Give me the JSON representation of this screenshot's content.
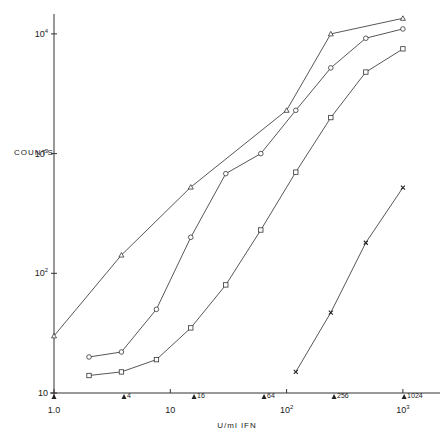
{
  "chart_data": {
    "type": "line",
    "title": "",
    "xlabel": "U/ml IFN",
    "ylabel": "COUNTS",
    "xscale": "log",
    "yscale": "log",
    "xlim": [
      1.0,
      1500
    ],
    "ylim": [
      10,
      15000
    ],
    "grid": false,
    "legend": null,
    "x_ticks": [
      {
        "value": 1,
        "label": "1.0"
      },
      {
        "value": 10,
        "label": "10"
      },
      {
        "value": 100,
        "label": "10",
        "sup": "2"
      },
      {
        "value": 1000,
        "label": "10",
        "sup": "3"
      }
    ],
    "y_ticks": [
      {
        "value": 10,
        "label": "10",
        "sup": ""
      },
      {
        "value": 100,
        "label": "10",
        "sup": "2"
      },
      {
        "value": 1000,
        "label": "10",
        "sup": "3"
      },
      {
        "value": 10000,
        "label": "10",
        "sup": "4"
      }
    ],
    "x_markers": [
      {
        "value": 1,
        "label": ""
      },
      {
        "value": 4,
        "label": "4"
      },
      {
        "value": 16,
        "label": "16"
      },
      {
        "value": 64,
        "label": "64"
      },
      {
        "value": 256,
        "label": "256"
      },
      {
        "value": 1024,
        "label": "1024"
      }
    ],
    "series": [
      {
        "name": "triangle",
        "marker": "triangle",
        "x": [
          1.0,
          3.8,
          15,
          100,
          240,
          1000
        ],
        "y": [
          30,
          142,
          525,
          2300,
          10000,
          13500
        ]
      },
      {
        "name": "circle",
        "marker": "circle",
        "x": [
          2,
          3.8,
          7.6,
          15,
          30,
          60,
          120,
          240,
          480,
          1000
        ],
        "y": [
          20,
          22,
          50,
          200,
          680,
          1000,
          2300,
          5200,
          9200,
          11000
        ]
      },
      {
        "name": "square",
        "marker": "square",
        "x": [
          2,
          3.8,
          7.6,
          15,
          30,
          60,
          120,
          240,
          480,
          1000
        ],
        "y": [
          14,
          15,
          19,
          35,
          80,
          230,
          700,
          2000,
          4800,
          7500
        ]
      },
      {
        "name": "cross",
        "marker": "x",
        "x": [
          120,
          240,
          480,
          1000
        ],
        "y": [
          15,
          47,
          180,
          520
        ]
      }
    ]
  }
}
